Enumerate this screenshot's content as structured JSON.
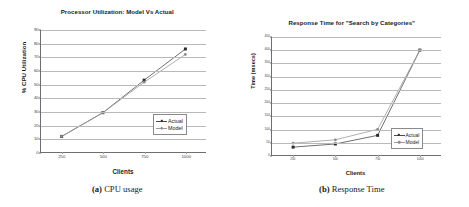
{
  "figure": {
    "panels": [
      {
        "caption_label": "(a)",
        "caption_text": "CPU usage"
      },
      {
        "caption_label": "(b)",
        "caption_text": "Response Time"
      }
    ]
  },
  "legend": {
    "actual_label": "Actual",
    "model_label": "Model"
  },
  "colors": {
    "actual_line": "#4a4a4a",
    "model_line": "#9b9b9b",
    "gridline": "#b9b9b9",
    "axis": "#6e6e6e",
    "text": "#1a1a1a"
  },
  "chart_data": [
    {
      "type": "line",
      "title": "Processor Utilization: Model Vs Actual",
      "xlabel": "Clients",
      "ylabel": "% CPU Utilization",
      "categories": [
        "250",
        "500",
        "750",
        "1000"
      ],
      "x": [
        250,
        500,
        750,
        1000
      ],
      "yticks": [
        "0",
        "10",
        "20",
        "30",
        "40",
        "50",
        "60",
        "70",
        "80",
        "90"
      ],
      "ytick_values": [
        0,
        10,
        20,
        30,
        40,
        50,
        60,
        70,
        80,
        90
      ],
      "ylim": [
        0,
        90
      ],
      "grid": true,
      "legend_position": "inside-right",
      "series": [
        {
          "name": "Actual",
          "values": [
            11.5,
            29,
            53,
            76
          ]
        },
        {
          "name": "Model",
          "values": [
            11.5,
            29,
            51.5,
            72
          ]
        }
      ]
    },
    {
      "type": "line",
      "title": "Response Time for \"Search by Categories\"",
      "xlabel": "Clients",
      "ylabel": "Time (msecs)",
      "categories": [
        "250",
        "500",
        "750",
        "1000"
      ],
      "x": [
        250,
        500,
        750,
        1000
      ],
      "yticks": [
        "0",
        "50",
        "100",
        "150",
        "200",
        "250",
        "300",
        "350",
        "400",
        "450"
      ],
      "ytick_values": [
        0,
        50,
        100,
        150,
        200,
        250,
        300,
        350,
        400,
        450
      ],
      "ylim": [
        0,
        450
      ],
      "grid": true,
      "legend_position": "inside-right",
      "series": [
        {
          "name": "Actual",
          "values": [
            30,
            42,
            75,
            400
          ]
        },
        {
          "name": "Model",
          "values": [
            45,
            58,
            98,
            400
          ]
        }
      ]
    }
  ]
}
